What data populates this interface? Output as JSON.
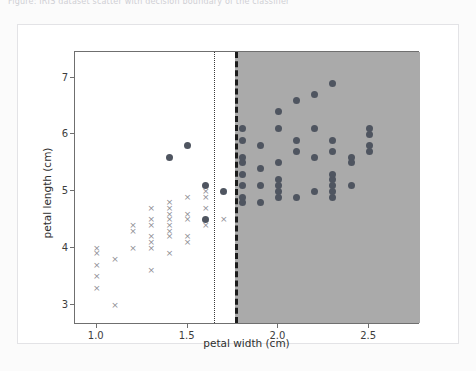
{
  "page": {
    "cut_off_header_text": "Figure: IRIS dataset scatter with decision boundary of the classifier",
    "background_color": "#fbfbfb",
    "card_background": "#ffffff"
  },
  "chart_data": {
    "type": "scatter",
    "title": "",
    "xlabel": "petal width (cm)",
    "ylabel": "petal length (cm)",
    "xlim": [
      0.88,
      2.78
    ],
    "ylim": [
      2.65,
      7.45
    ],
    "xticks": [
      1.0,
      1.5,
      2.0,
      2.5
    ],
    "xtick_labels": [
      "1.0",
      "1.5",
      "2.0",
      "2.5"
    ],
    "yticks": [
      3,
      4,
      5,
      6,
      7
    ],
    "ytick_labels": [
      "3",
      "4",
      "5",
      "6",
      "7"
    ],
    "grid": false,
    "legend": null,
    "legend_position": "none",
    "marker_colors": {
      "cross": "#8d8d93",
      "circle": "#4f5560",
      "shaded_region": "#aaaaaa",
      "unshaded_region": "#ffffff",
      "dotted_line": "#3a3a3a",
      "dashed_line": "#1c1c1c"
    },
    "annotations": [
      {
        "name": "decision-boundary-dotted",
        "type": "vline",
        "style": "dotted",
        "x": 1.645
      },
      {
        "name": "decision-boundary-dashed",
        "type": "vline",
        "style": "dashed",
        "x": 1.76
      }
    ],
    "regions": [
      {
        "name": "predicted-class-region-shaded",
        "x_from": 1.76,
        "x_to": 2.78,
        "fill": "#aaaaaa"
      }
    ],
    "series": [
      {
        "name": "versicolor",
        "marker": "x",
        "color": "#8d8d93",
        "points": [
          [
            1.0,
            3.3
          ],
          [
            1.0,
            3.5
          ],
          [
            1.0,
            4.0
          ],
          [
            1.0,
            3.7
          ],
          [
            1.0,
            3.9
          ],
          [
            1.1,
            3.0
          ],
          [
            1.1,
            3.8
          ],
          [
            1.2,
            4.0
          ],
          [
            1.2,
            4.4
          ],
          [
            1.2,
            4.3
          ],
          [
            1.3,
            4.0
          ],
          [
            1.3,
            4.2
          ],
          [
            1.3,
            4.4
          ],
          [
            1.3,
            4.5
          ],
          [
            1.3,
            4.7
          ],
          [
            1.3,
            4.1
          ],
          [
            1.3,
            3.6
          ],
          [
            1.4,
            4.4
          ],
          [
            1.4,
            4.5
          ],
          [
            1.4,
            4.6
          ],
          [
            1.4,
            4.7
          ],
          [
            1.4,
            4.8
          ],
          [
            1.4,
            4.3
          ],
          [
            1.4,
            4.2
          ],
          [
            1.4,
            3.9
          ],
          [
            1.5,
            4.2
          ],
          [
            1.5,
            4.5
          ],
          [
            1.5,
            4.6
          ],
          [
            1.5,
            4.9
          ],
          [
            1.5,
            4.1
          ],
          [
            1.6,
            4.4
          ],
          [
            1.6,
            4.5
          ],
          [
            1.6,
            4.7
          ],
          [
            1.6,
            5.0
          ],
          [
            1.6,
            4.9
          ],
          [
            1.7,
            5.0
          ],
          [
            1.7,
            4.5
          ],
          [
            1.8,
            4.8
          ],
          [
            1.8,
            5.1
          ],
          [
            1.8,
            4.9
          ],
          [
            1.9,
            5.1
          ]
        ]
      },
      {
        "name": "virginica",
        "marker": "o",
        "color": "#4f5560",
        "points": [
          [
            1.4,
            5.6
          ],
          [
            1.5,
            5.8
          ],
          [
            1.6,
            5.1
          ],
          [
            1.6,
            4.5
          ],
          [
            1.7,
            5.0
          ],
          [
            1.8,
            5.5
          ],
          [
            1.8,
            5.9
          ],
          [
            1.8,
            5.6
          ],
          [
            1.8,
            5.1
          ],
          [
            1.8,
            4.9
          ],
          [
            1.8,
            4.8
          ],
          [
            1.8,
            5.3
          ],
          [
            1.8,
            6.1
          ],
          [
            1.9,
            5.1
          ],
          [
            1.9,
            5.4
          ],
          [
            1.9,
            5.8
          ],
          [
            1.9,
            4.8
          ],
          [
            2.0,
            4.9
          ],
          [
            2.0,
            5.1
          ],
          [
            2.0,
            5.0
          ],
          [
            2.0,
            5.2
          ],
          [
            2.0,
            5.5
          ],
          [
            2.0,
            6.1
          ],
          [
            2.0,
            6.4
          ],
          [
            2.1,
            5.7
          ],
          [
            2.1,
            5.9
          ],
          [
            2.1,
            6.6
          ],
          [
            2.1,
            4.9
          ],
          [
            2.2,
            5.6
          ],
          [
            2.2,
            5.0
          ],
          [
            2.2,
            6.7
          ],
          [
            2.2,
            6.1
          ],
          [
            2.3,
            5.1
          ],
          [
            2.3,
            5.0
          ],
          [
            2.3,
            5.9
          ],
          [
            2.3,
            5.7
          ],
          [
            2.3,
            6.9
          ],
          [
            2.3,
            5.2
          ],
          [
            2.3,
            4.9
          ],
          [
            2.3,
            5.3
          ],
          [
            2.4,
            5.1
          ],
          [
            2.4,
            5.6
          ],
          [
            2.4,
            5.5
          ],
          [
            2.5,
            6.0
          ],
          [
            2.5,
            5.8
          ],
          [
            2.5,
            6.1
          ],
          [
            2.5,
            5.7
          ]
        ]
      }
    ]
  }
}
